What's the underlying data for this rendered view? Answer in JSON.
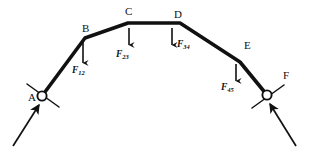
{
  "figure": {
    "kind": "free-body-diagram",
    "width": 309,
    "height": 149,
    "background_color": "#ffffff",
    "ink_color": "#111111"
  },
  "joints": [
    {
      "id": "A",
      "label": "A",
      "x": 42,
      "y": 96,
      "type": "pin-support",
      "label_x": 28,
      "label_y": 92
    },
    {
      "id": "B",
      "label": "B",
      "x": 85,
      "y": 38,
      "type": "vertex",
      "label_x": 82,
      "label_y": 23
    },
    {
      "id": "C",
      "label": "C",
      "x": 128,
      "y": 23,
      "type": "vertex",
      "label_x": 125,
      "label_y": 6
    },
    {
      "id": "D",
      "label": "D",
      "x": 180,
      "y": 23,
      "type": "vertex",
      "label_x": 174,
      "label_y": 9
    },
    {
      "id": "E",
      "label": "E",
      "x": 240,
      "y": 62,
      "type": "vertex",
      "label_x": 244,
      "label_y": 40
    },
    {
      "id": "F",
      "label": "F",
      "x": 267,
      "y": 95,
      "type": "pin-support",
      "label_x": 283,
      "label_y": 70
    }
  ],
  "members": {
    "name": "cable-polyline",
    "points": "42,96 85,38 128,23 180,23 240,62 267,95",
    "stroke_width": 3.6
  },
  "loads": [
    {
      "id": "F12",
      "label": "F",
      "subscript": "12",
      "arrow": {
        "x": 83,
        "y_start": 42,
        "y_end": 63
      },
      "label_x": 72,
      "label_y": 66,
      "direction": "down"
    },
    {
      "id": "F23",
      "label": "F",
      "subscript": "23",
      "arrow": {
        "x": 129,
        "y_start": 28,
        "y_end": 45
      },
      "label_x": 116,
      "label_y": 50,
      "direction": "down"
    },
    {
      "id": "F34",
      "label": "F",
      "subscript": "34",
      "arrow": {
        "x": 172,
        "y_start": 28,
        "y_end": 45
      },
      "label_x": 177,
      "label_y": 40,
      "direction": "down"
    },
    {
      "id": "F45",
      "label": "F",
      "subscript": "45",
      "arrow": {
        "x": 236,
        "y_start": 64,
        "y_end": 81
      },
      "label_x": 221,
      "label_y": 83,
      "direction": "down"
    }
  ],
  "supports": [
    {
      "id": "support-A",
      "joint": "A",
      "circle": {
        "cx": 42,
        "cy": 96,
        "r": 4.6
      },
      "ground_line": {
        "x1": 27,
        "y1": 84,
        "x2": 59,
        "y2": 107
      },
      "reaction_arrow": {
        "x1": 13,
        "y1": 146,
        "x2": 39,
        "y2": 105
      }
    },
    {
      "id": "support-F",
      "joint": "F",
      "circle": {
        "cx": 267,
        "cy": 95,
        "r": 4.6
      },
      "ground_line": {
        "x1": 252,
        "y1": 108,
        "x2": 284,
        "y2": 85
      },
      "reaction_arrow": {
        "x1": 296,
        "y1": 146,
        "x2": 270,
        "y2": 104
      }
    }
  ]
}
